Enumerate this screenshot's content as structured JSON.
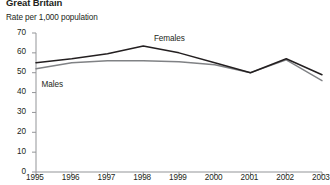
{
  "header": {
    "region_title": "Great Britain",
    "axis_title": "Rate per 1,000 population"
  },
  "series_labels": {
    "females": "Females",
    "males": "Males"
  },
  "colors": {
    "females_line": "#231f20",
    "males_line": "#808285",
    "axis": "#939598",
    "text": "#231f20",
    "background": "#ffffff"
  },
  "chart_data": {
    "type": "line",
    "title": "Great Britain",
    "subtitle": "Rate per 1,000 population",
    "xlabel": "",
    "ylabel": "Rate per 1,000 population",
    "x": [
      1995,
      1996,
      1997,
      1998,
      1999,
      2000,
      2001,
      2002,
      2003
    ],
    "categories": [
      "1995",
      "1996",
      "1997",
      "1998",
      "1999",
      "2000",
      "2001",
      "2002",
      "2003"
    ],
    "series": [
      {
        "name": "Females",
        "color": "#231f20",
        "values": [
          55,
          57,
          59.5,
          63.5,
          60,
          55,
          50,
          57,
          49
        ]
      },
      {
        "name": "Males",
        "color": "#808285",
        "values": [
          52,
          55,
          56,
          56,
          55.5,
          54,
          50,
          56.5,
          46
        ]
      }
    ],
    "ylim": [
      0,
      70
    ],
    "yticks": [
      0,
      10,
      20,
      30,
      40,
      50,
      60,
      70
    ],
    "ytick_labels": [
      "0",
      "10",
      "20",
      "30",
      "40",
      "50",
      "60",
      "70"
    ],
    "xlim": [
      1995,
      2003
    ],
    "xticks": [
      1995,
      1996,
      1997,
      1998,
      1999,
      2000,
      2001,
      2002,
      2003
    ],
    "xtick_labels": [
      "1995",
      "1996",
      "1997",
      "1998",
      "1999",
      "2000",
      "2001",
      "2002",
      "2003"
    ],
    "grid": false,
    "legend": "inline-annotations",
    "annotations": [
      {
        "text": "Females",
        "x": 1998.3,
        "y": 67
      },
      {
        "text": "Males",
        "x": 1995.1,
        "y": 44
      }
    ]
  }
}
